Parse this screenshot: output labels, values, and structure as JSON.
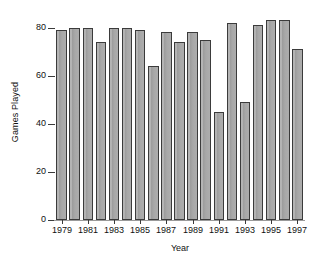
{
  "chart_data": {
    "type": "bar",
    "title": "",
    "xlabel": "Year",
    "ylabel": "Games Played",
    "categories": [
      1979,
      1980,
      1981,
      1982,
      1983,
      1984,
      1985,
      1986,
      1987,
      1988,
      1989,
      1990,
      1991,
      1992,
      1993,
      1994,
      1995,
      1996,
      1997
    ],
    "values": [
      79,
      80,
      80,
      74,
      80,
      80,
      79,
      64,
      78,
      74,
      78,
      75,
      45,
      82,
      49,
      81,
      83,
      83,
      71
    ],
    "ylim": [
      0,
      84
    ],
    "yticks": [
      0,
      20,
      40,
      60,
      80
    ],
    "ytick_labels": [
      "0",
      "20",
      "40",
      "60",
      "80"
    ],
    "xticks": [
      1979,
      1981,
      1983,
      1985,
      1987,
      1989,
      1991,
      1993,
      1995,
      1997
    ],
    "xtick_labels": [
      "1979",
      "1981",
      "1983",
      "1985",
      "1987",
      "1989",
      "1991",
      "1993",
      "1995",
      "1997"
    ],
    "grid": false,
    "legend": false,
    "bar_color": "#a9a9a9",
    "bar_edge_color": "#3b3b3b",
    "axis_color": "#3a3a3a",
    "background": "#ffffff"
  }
}
